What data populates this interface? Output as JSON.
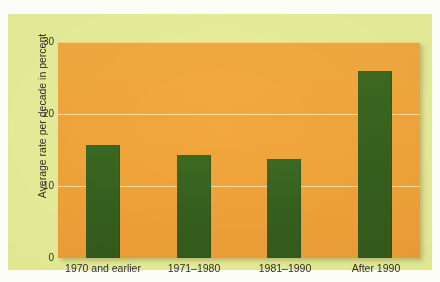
{
  "chart_data": {
    "type": "bar",
    "title": "",
    "subtitle": "",
    "xlabel": "",
    "ylabel": "Average rate per decade in percent",
    "categories": [
      "1970 and earlier",
      "1971–1980",
      "1981–1990",
      "After 1990"
    ],
    "values": [
      15.7,
      14.3,
      13.8,
      26.0
    ],
    "series": [
      {
        "name": "Average rate per decade in percent",
        "values": [
          15.7,
          14.3,
          13.8,
          26.0
        ]
      }
    ],
    "ylim": [
      0,
      30
    ],
    "yticks": [
      0,
      10,
      20,
      30
    ],
    "ytick_labels": [
      "0",
      "10",
      "20",
      "30"
    ],
    "grid": true,
    "grid_axis": "y",
    "legend": false,
    "legend_position": "none",
    "annotations": [],
    "colors": {
      "bar": "#37601e",
      "plot_background": "#f2a63c",
      "panel_background": "#e9f09c",
      "gridline": "#fff6c8",
      "text": "#2f2f28",
      "page_background": "#fdfdf8"
    }
  },
  "axis": {
    "y_title": "Average rate per decade in percent",
    "y_tick_0": "0",
    "y_tick_1": "10",
    "y_tick_2": "20",
    "y_tick_3": "30",
    "x_cat_0": "1970 and earlier",
    "x_cat_1": "1971–1980",
    "x_cat_2": "1981–1990",
    "x_cat_3": "After 1990"
  }
}
